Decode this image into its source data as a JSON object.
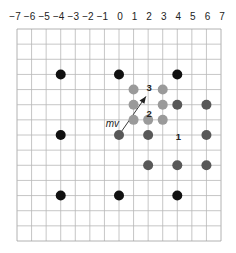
{
  "diagram": {
    "type": "motion-vector-grid",
    "x_axis": {
      "ticks": [
        -7,
        -6,
        -5,
        -4,
        -3,
        -2,
        -1,
        0,
        1,
        2,
        3,
        4,
        5,
        6,
        7
      ],
      "tick_labels": [
        "−7",
        "−6",
        "−5",
        "−4",
        "−3",
        "−2",
        "−1",
        "0",
        "1",
        "2",
        "3",
        "4",
        "5",
        "6",
        "7"
      ]
    },
    "grid": {
      "columns": 14,
      "rows": 14,
      "line_color": "#b8b8b8",
      "border_color": "#a0a0a0"
    },
    "colors": {
      "black": "#111111",
      "dark_gray": "#585858",
      "light_gray": "#9a9a9a",
      "arrow": "#222222",
      "label": "#222222"
    },
    "dots": [
      {
        "x": -4,
        "row": 3,
        "color": "black"
      },
      {
        "x": 0,
        "row": 3,
        "color": "black"
      },
      {
        "x": 4,
        "row": 3,
        "color": "black"
      },
      {
        "x": -4,
        "row": 7,
        "color": "black"
      },
      {
        "x": -4,
        "row": 11,
        "color": "black"
      },
      {
        "x": 0,
        "row": 11,
        "color": "black"
      },
      {
        "x": 4,
        "row": 11,
        "color": "black"
      },
      {
        "x": 0,
        "row": 7,
        "color": "dark_gray"
      },
      {
        "x": 2,
        "row": 7,
        "color": "dark_gray"
      },
      {
        "x": 6,
        "row": 7,
        "color": "dark_gray"
      },
      {
        "x": 4,
        "row": 5,
        "color": "dark_gray"
      },
      {
        "x": 6,
        "row": 5,
        "color": "dark_gray"
      },
      {
        "x": 2,
        "row": 9,
        "color": "dark_gray"
      },
      {
        "x": 4,
        "row": 9,
        "color": "dark_gray"
      },
      {
        "x": 6,
        "row": 9,
        "color": "dark_gray"
      },
      {
        "x": 1,
        "row": 4,
        "color": "light_gray"
      },
      {
        "x": 3,
        "row": 4,
        "color": "light_gray"
      },
      {
        "x": 1,
        "row": 5,
        "color": "light_gray"
      },
      {
        "x": 3,
        "row": 5,
        "color": "light_gray"
      },
      {
        "x": 1,
        "row": 6,
        "color": "light_gray"
      },
      {
        "x": 2,
        "row": 6,
        "color": "light_gray"
      },
      {
        "x": 3,
        "row": 6,
        "color": "light_gray"
      }
    ],
    "labels": [
      {
        "text": "3",
        "x": 2,
        "row": 3.85
      },
      {
        "text": "2",
        "x": 2,
        "row": 5.55
      },
      {
        "text": "1",
        "x": 4,
        "row": 7.1
      }
    ],
    "motion_vector": {
      "label": "mv",
      "from": {
        "x": 0,
        "row": 7
      },
      "to": {
        "x": 1.85,
        "row": 4.45
      }
    }
  }
}
